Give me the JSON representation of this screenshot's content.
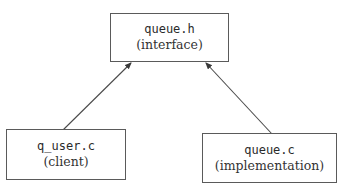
{
  "diagram": {
    "nodes": [
      {
        "id": "queue_h",
        "file": "queue.h",
        "role": "(interface)"
      },
      {
        "id": "q_user_c",
        "file": "q_user.c",
        "role": "(client)"
      },
      {
        "id": "queue_c",
        "file": "queue.c",
        "role": "(implementation)"
      }
    ],
    "edges": [
      {
        "from": "q_user_c",
        "to": "queue_h",
        "style": "arrow"
      },
      {
        "from": "queue_c",
        "to": "queue_h",
        "style": "arrow"
      }
    ],
    "colors": {
      "border": "#5a5a5a",
      "edge": "#4a4a4a",
      "text": "#2a2a2a",
      "background": "#ffffff"
    }
  }
}
